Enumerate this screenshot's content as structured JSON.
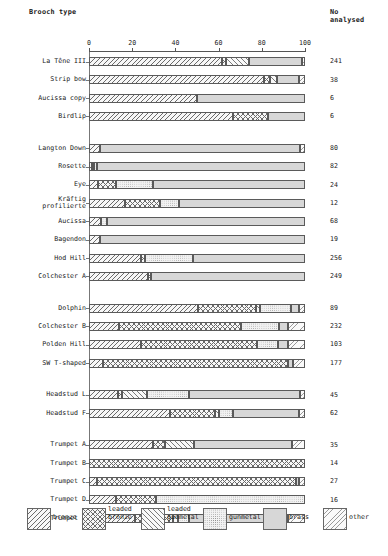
{
  "header": {
    "brooch_type_label": "Brooch type",
    "count_label": "No\nanalysed"
  },
  "chart_data": {
    "type": "bar",
    "orientation": "horizontal",
    "stacked": true,
    "title": "",
    "xlabel": "",
    "ylabel": "Brooch type",
    "xlim": [
      0,
      100
    ],
    "xticks": [
      0,
      20,
      40,
      60,
      80,
      100
    ],
    "xticklabels": [
      "0",
      "20",
      "40",
      "60",
      "80",
      "100"
    ],
    "grid": false,
    "legend_position": "bottom",
    "legend": [
      "bronze",
      "leaded bronze",
      "leaded gunmetal",
      "gunmetal",
      "brass",
      "other"
    ],
    "series": [
      {
        "name": "bronze",
        "key": "bronze",
        "fill": "f-bronze"
      },
      {
        "name": "leaded bronze",
        "key": "leaded_bronze",
        "fill": "f-leaded-bronze"
      },
      {
        "name": "leaded gunmetal",
        "key": "leaded_gunmetal",
        "fill": "f-leaded-gunmetal"
      },
      {
        "name": "gunmetal",
        "key": "gunmetal",
        "fill": "f-gunmetal"
      },
      {
        "name": "brass",
        "key": "brass",
        "fill": "f-brass"
      },
      {
        "name": "other",
        "key": "other",
        "fill": "f-other"
      }
    ],
    "groups": [
      {
        "rows": [
          {
            "category": "La Têne III",
            "n": "241",
            "values": [
              61.5,
              2.0,
              10.5,
              0.0,
              24.5,
              1.5
            ]
          },
          {
            "category": "Strip bow",
            "n": "38",
            "values": [
              81.0,
              3.0,
              3.0,
              0.0,
              10.0,
              3.0
            ]
          },
          {
            "category": "Aucissa copy",
            "n": "6",
            "values": [
              50.0,
              0.0,
              0.0,
              0.0,
              50.0,
              0.0
            ]
          },
          {
            "category": "Birdlip",
            "n": "6",
            "values": [
              66.5,
              16.5,
              0.0,
              0.0,
              17.0,
              0.0
            ]
          }
        ]
      },
      {
        "rows": [
          {
            "category": "Langton Down",
            "n": "80",
            "values": [
              5.0,
              0.0,
              0.0,
              0.0,
              92.5,
              2.5
            ]
          },
          {
            "category": "Rosette",
            "n": "82",
            "values": [
              1.2,
              1.2,
              0.0,
              1.2,
              96.4,
              0.0
            ]
          },
          {
            "category": "Eye",
            "n": "24",
            "values": [
              4.0,
              8.5,
              0.0,
              17.0,
              70.5,
              0.0
            ]
          },
          {
            "category": "Kräftig\nprofilierte",
            "n": "12",
            "values": [
              16.5,
              16.5,
              0.0,
              8.5,
              58.5,
              0.0
            ]
          },
          {
            "category": "Aucissa",
            "n": "68",
            "values": [
              5.5,
              0.0,
              0.0,
              3.0,
              91.5,
              0.0
            ]
          },
          {
            "category": "Bagendon",
            "n": "19",
            "values": [
              5.2,
              0.0,
              0.0,
              0.0,
              94.8,
              0.0
            ]
          },
          {
            "category": "Hod Hill",
            "n": "256",
            "values": [
              24.0,
              2.0,
              0.0,
              22.0,
              52.0,
              0.0
            ]
          },
          {
            "category": "Colchester A",
            "n": "249",
            "values": [
              27.5,
              1.0,
              0.0,
              0.0,
              71.5,
              0.0
            ]
          }
        ]
      },
      {
        "rows": [
          {
            "category": "Dolphin",
            "n": "89",
            "values": [
              50.5,
              27.0,
              1.5,
              14.5,
              3.5,
              3.0
            ]
          },
          {
            "category": "Colchester B",
            "n": "232",
            "values": [
              14.0,
              56.5,
              0.0,
              17.5,
              4.0,
              8.0
            ]
          },
          {
            "category": "Polden Hill",
            "n": "103",
            "values": [
              24.0,
              54.0,
              0.0,
              9.5,
              4.5,
              8.0
            ]
          },
          {
            "category": "SW T-shaped",
            "n": "177",
            "values": [
              6.5,
              85.5,
              0.0,
              0.0,
              2.5,
              5.5
            ]
          }
        ]
      },
      {
        "rows": [
          {
            "category": "Headstud L",
            "n": "45",
            "values": [
              13.5,
              2.0,
              11.5,
              19.5,
              51.0,
              2.5
            ]
          },
          {
            "category": "Headstud F",
            "n": "62",
            "values": [
              37.5,
              21.0,
              1.5,
              6.5,
              30.5,
              3.0
            ]
          }
        ]
      },
      {
        "rows": [
          {
            "category": "Trumpet A",
            "n": "35",
            "values": [
              29.5,
              5.5,
              13.5,
              0.0,
              45.5,
              6.0
            ]
          },
          {
            "category": "Trumpet B",
            "n": "14",
            "values": [
              0.0,
              100.0,
              0.0,
              0.0,
              0.0,
              0.0
            ]
          },
          {
            "category": "Trumpet C",
            "n": "27",
            "values": [
              3.5,
              92.5,
              0.0,
              0.0,
              1.0,
              3.0
            ]
          },
          {
            "category": "Trumpet D",
            "n": "16",
            "values": [
              12.5,
              18.5,
              0.0,
              69.0,
              0.0,
              0.0
            ]
          },
          {
            "category": "Trumpet E",
            "n": "51",
            "values": [
              21.5,
              17.5,
              2.0,
              5.5,
              45.5,
              8.0
            ]
          }
        ]
      }
    ]
  }
}
